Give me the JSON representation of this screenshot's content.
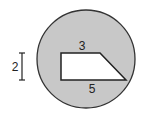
{
  "diagram": {
    "circle": {
      "fill": "#c8c8c8",
      "stroke": "#333333"
    },
    "trapezoid": {
      "fill": "#ffffff",
      "stroke": "#222222"
    },
    "labels": {
      "top_base": "3",
      "bottom_base": "5",
      "height": "2"
    }
  }
}
